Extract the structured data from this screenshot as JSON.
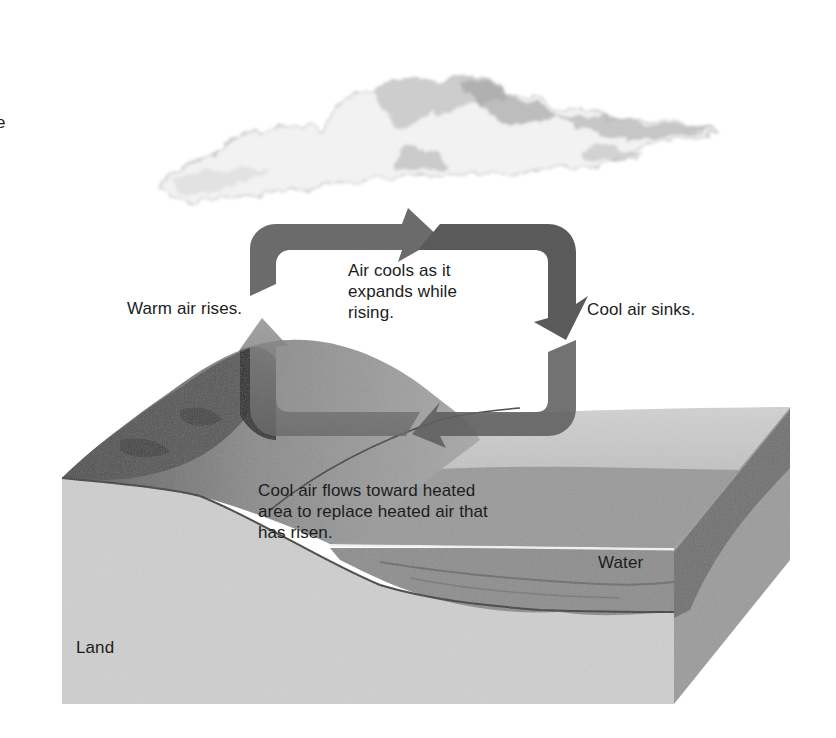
{
  "figure": {
    "partial_label_top_left": "e",
    "labels": {
      "warm_air_rises": "Warm air rises.",
      "air_cools": "Air cools as it\nexpands while\nrising.",
      "cool_air_sinks": "Cool air sinks.",
      "cool_air_flows": "Cool air flows toward heated\narea to replace heated air that\nhas risen.",
      "water": "Water",
      "land": "Land"
    },
    "elements": {
      "cloud": "cumulus-cloud",
      "circulation_loop": "four-arrow convection loop (clockwise: up on left, right on top, down on right, left on bottom)",
      "terrain_block": "cross-section block of land and water"
    },
    "colors": {
      "background": "#ffffff",
      "arrow_dark": "#5c5c5c",
      "arrow_light": "#8e8e8e",
      "land_front": "#cfcfcf",
      "land_side": "#9a9a9a",
      "hill": "#7a7a7a",
      "forest": "#4a4a4a",
      "water_surface": "#b9b9b9",
      "water_body": "#8c8c8c",
      "water_side": "#6e6e6e",
      "text": "#1c1c1c"
    }
  }
}
